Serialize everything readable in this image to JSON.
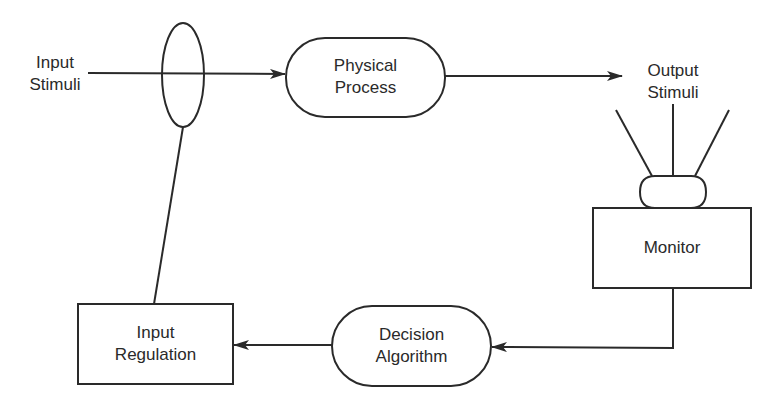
{
  "diagram": {
    "type": "feedback-control-loop",
    "nodes": [
      {
        "id": "input_stimuli",
        "shape": "text",
        "lines": [
          "Input",
          "Stimuli"
        ]
      },
      {
        "id": "regulator_valve",
        "shape": "ellipse",
        "lines": []
      },
      {
        "id": "physical_process",
        "shape": "pill",
        "lines": [
          "Physical",
          "Process"
        ]
      },
      {
        "id": "output_stimuli",
        "shape": "text",
        "lines": [
          "Output",
          "Stimuli"
        ]
      },
      {
        "id": "sensor",
        "shape": "pill-small",
        "lines": []
      },
      {
        "id": "monitor",
        "shape": "rectangle",
        "lines": [
          "Monitor"
        ]
      },
      {
        "id": "decision_algorithm",
        "shape": "pill",
        "lines": [
          "Decision",
          "Algorithm"
        ]
      },
      {
        "id": "input_regulation",
        "shape": "rectangle",
        "lines": [
          "Input",
          "Regulation"
        ]
      }
    ],
    "edges": [
      {
        "from": "input_stimuli",
        "to": "physical_process",
        "via": "regulator_valve",
        "arrow": true
      },
      {
        "from": "physical_process",
        "to": "output_stimuli",
        "arrow": true
      },
      {
        "from": "output_stimuli",
        "to": "sensor",
        "style": "three-antenna-lines",
        "arrow": false
      },
      {
        "from": "monitor",
        "to": "decision_algorithm",
        "arrow": true
      },
      {
        "from": "decision_algorithm",
        "to": "input_regulation",
        "arrow": true
      },
      {
        "from": "input_regulation",
        "to": "regulator_valve",
        "arrow": false
      }
    ]
  },
  "labels": {
    "input_stimuli_1": "Input",
    "input_stimuli_2": "Stimuli",
    "physical_process_1": "Physical",
    "physical_process_2": "Process",
    "output_stimuli_1": "Output",
    "output_stimuli_2": "Stimuli",
    "monitor": "Monitor",
    "decision_algorithm_1": "Decision",
    "decision_algorithm_2": "Algorithm",
    "input_regulation_1": "Input",
    "input_regulation_2": "Regulation"
  },
  "colors": {
    "stroke": "#2a2a2a",
    "background": "#ffffff"
  }
}
